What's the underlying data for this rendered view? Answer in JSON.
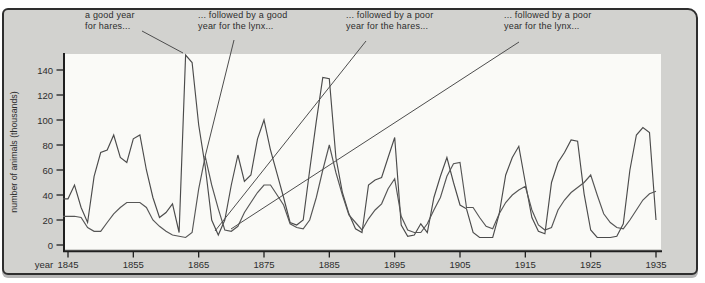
{
  "axes": {
    "y_title": "number of animals (thousands)",
    "x_title": "year"
  },
  "annotations": [
    {
      "line1": "a good year",
      "line2": "for hares..."
    },
    {
      "line1": "... followed by a good",
      "line2": "year for the lynx..."
    },
    {
      "line1": "... followed by a poor",
      "line2": "year for the hares..."
    },
    {
      "line1": "... followed by a poor",
      "line2": "year for the lynx..."
    }
  ],
  "chart_data": {
    "type": "line",
    "title": "",
    "xlabel": "year",
    "ylabel": "number of animals (thousands)",
    "xlim": [
      1845,
      1935
    ],
    "ylim": [
      0,
      155
    ],
    "grid": false,
    "legend_position": "none",
    "x_start": 1845,
    "x_step": 1,
    "xticks": [
      1845,
      1855,
      1865,
      1875,
      1885,
      1895,
      1905,
      1915,
      1925,
      1935
    ],
    "yticks": [
      0,
      20,
      40,
      60,
      80,
      100,
      120,
      140
    ],
    "series": [
      {
        "name": "hares",
        "color": "#4b4b4b",
        "values": [
          37,
          48,
          30,
          18,
          55,
          74,
          76,
          88,
          70,
          66,
          85,
          88,
          60,
          38,
          22,
          26,
          33,
          10,
          152,
          146,
          96,
          63,
          20,
          8,
          20,
          48,
          72,
          51,
          56,
          85,
          100,
          76,
          57,
          38,
          18,
          16,
          20,
          60,
          99,
          134,
          133,
          70,
          42,
          25,
          13,
          10,
          48,
          52,
          54,
          70,
          86,
          16,
          7,
          8,
          17,
          10,
          38,
          55,
          70,
          50,
          32,
          29,
          10,
          6,
          6,
          6,
          25,
          56,
          70,
          79,
          50,
          22,
          11,
          9,
          50,
          66,
          74,
          84,
          83,
          41,
          12,
          6,
          6,
          6,
          7,
          17,
          60,
          88,
          94,
          90,
          20
        ]
      },
      {
        "name": "lynx",
        "color": "#565656",
        "values": [
          23,
          23,
          22,
          14,
          11,
          11,
          18,
          25,
          30,
          34,
          34,
          34,
          30,
          20,
          15,
          11,
          8,
          7,
          6,
          10,
          45,
          71,
          48,
          29,
          12,
          11,
          15,
          26,
          34,
          42,
          48,
          48,
          40,
          32,
          17,
          14,
          13,
          20,
          38,
          60,
          80,
          58,
          40,
          24,
          18,
          12,
          21,
          28,
          33,
          45,
          53,
          23,
          12,
          10,
          10,
          17,
          28,
          38,
          55,
          65,
          66,
          30,
          30,
          22,
          15,
          13,
          25,
          34,
          40,
          44,
          47,
          28,
          16,
          12,
          14,
          28,
          36,
          42,
          46,
          50,
          56,
          40,
          25,
          18,
          14,
          13,
          20,
          28,
          36,
          41,
          43
        ]
      }
    ],
    "annotations": [
      {
        "text": "a good year for hares...",
        "points_to": "hare peak ~152 in 1863"
      },
      {
        "text": "... followed by a good year for the lynx...",
        "points_to": "lynx peak ~71 in 1866"
      },
      {
        "text": "... followed by a poor year for the hares...",
        "points_to": "hare low ~8 in 1868"
      },
      {
        "text": "... followed by a poor year for the lynx...",
        "points_to": "lynx low ~11 in 1870"
      }
    ]
  },
  "colors": {
    "panel_bg": "#d2d2cf",
    "plot_bg": "#fafaf7",
    "axis": "#1f1f1f",
    "text": "#2d2d2d",
    "border": "#2e2e2e"
  }
}
